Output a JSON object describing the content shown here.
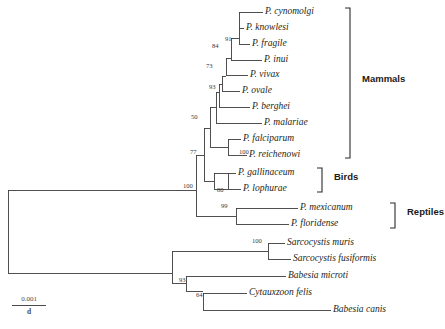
{
  "figure": {
    "type": "phylogenetic-tree",
    "orientation": "rectangular-left-to-right",
    "root_x": 8,
    "scale_bar": {
      "numerator": "0.001",
      "denominator": "d"
    }
  },
  "taxa": [
    {
      "id": "p-cynomolgi",
      "label": "P. cynomolgi",
      "x": 265,
      "y": 12,
      "branch_x": 239
    },
    {
      "id": "p-knowlesi",
      "label": "P. knowlesi",
      "x": 246,
      "y": 28,
      "branch_x": 239
    },
    {
      "id": "p-fragile",
      "label": "P. fragile",
      "x": 252,
      "y": 44,
      "branch_x": 239
    },
    {
      "id": "p-inui",
      "label": "P. inui",
      "x": 264,
      "y": 60,
      "branch_x": 239
    },
    {
      "id": "p-vivax",
      "label": "P. vivax",
      "x": 250,
      "y": 75,
      "branch_x": 235
    },
    {
      "id": "p-ovale",
      "label": "P. ovale",
      "x": 242,
      "y": 91,
      "branch_x": 222
    },
    {
      "id": "p-berghei",
      "label": "P. berghei",
      "x": 252,
      "y": 107,
      "branch_x": 219
    },
    {
      "id": "p-malariae",
      "label": "P. malariae",
      "x": 264,
      "y": 123,
      "branch_x": 216
    },
    {
      "id": "p-falciparum",
      "label": "P. falciparum",
      "x": 242,
      "y": 139,
      "branch_x": 228
    },
    {
      "id": "p-reichenowi",
      "label": "P. reichenowi",
      "x": 249,
      "y": 155,
      "branch_x": 228
    },
    {
      "id": "p-gallinaceum",
      "label": "P. gallinaceum",
      "x": 238,
      "y": 173,
      "branch_x": 228
    },
    {
      "id": "p-lophurae",
      "label": "P. lophurae",
      "x": 243,
      "y": 189,
      "branch_x": 228
    },
    {
      "id": "p-mexicanum",
      "label": "P. mexicanum",
      "x": 300,
      "y": 208,
      "branch_x": 240
    },
    {
      "id": "p-floridense",
      "label": "P. floridense",
      "x": 291,
      "y": 224,
      "branch_x": 240
    },
    {
      "id": "s-muris",
      "label": "Sarcocystis muris",
      "x": 287,
      "y": 243,
      "branch_x": 268
    },
    {
      "id": "s-fusiformis",
      "label": "Sarcocystis fusiformis",
      "x": 293,
      "y": 259,
      "branch_x": 268
    },
    {
      "id": "b-microti",
      "label": "Babesia microti",
      "x": 288,
      "y": 276,
      "branch_x": 258
    },
    {
      "id": "c-felis",
      "label": "Cytauxzoon felis",
      "x": 249,
      "y": 293,
      "branch_x": 220
    },
    {
      "id": "b-canis",
      "label": "Babesia canis",
      "x": 333,
      "y": 310,
      "branch_x": 300
    }
  ],
  "support_values": [
    {
      "id": "node-91",
      "value": "91",
      "x": 225,
      "y": 39
    },
    {
      "id": "node-84",
      "value": "84",
      "x": 212,
      "y": 46
    },
    {
      "id": "node-73",
      "value": "73",
      "x": 206,
      "y": 66
    },
    {
      "id": "node-93",
      "value": "93",
      "x": 209,
      "y": 87
    },
    {
      "id": "node-50",
      "value": "50",
      "x": 191,
      "y": 117
    },
    {
      "id": "node-77",
      "value": "77",
      "x": 190,
      "y": 152
    },
    {
      "id": "node-100a",
      "value": "100",
      "x": 241,
      "y": 152
    },
    {
      "id": "node-100b",
      "value": "100",
      "x": 185,
      "y": 180
    },
    {
      "id": "node-80",
      "value": "80",
      "x": 219,
      "y": 186
    },
    {
      "id": "node-99",
      "value": "99",
      "x": 222,
      "y": 206
    },
    {
      "id": "node-100c",
      "value": "100",
      "x": 254,
      "y": 240
    },
    {
      "id": "node-93b",
      "value": "93",
      "x": 180,
      "y": 274
    },
    {
      "id": "node-64",
      "value": "64",
      "x": 198,
      "y": 291
    }
  ],
  "groups": [
    {
      "id": "group-mammals",
      "label": "Mammals",
      "bracket_x": 350,
      "bracket_top": 8,
      "bracket_bottom": 158,
      "label_x": 362,
      "label_y": 78
    },
    {
      "id": "group-birds",
      "label": "Birds",
      "bracket_x": 322,
      "bracket_top": 168,
      "bracket_bottom": 192,
      "label_x": 334,
      "label_y": 176
    },
    {
      "id": "group-reptiles",
      "label": "Reptiles",
      "bracket_x": 395,
      "bracket_top": 203,
      "bracket_bottom": 228,
      "label_x": 407,
      "label_y": 211
    }
  ]
}
